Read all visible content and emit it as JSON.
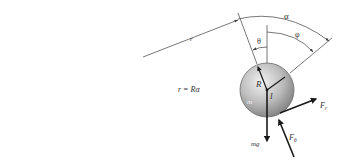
{
  "diagram": {
    "type": "physics-free-body-diagram",
    "labels": {
      "r": "r",
      "alpha": "α",
      "theta": "θ",
      "phi": "φ",
      "R": "R",
      "I": "I",
      "m": "m",
      "mg": "mg",
      "F_r_main": "F",
      "F_r_sub": "r",
      "F_theta_main": "F",
      "F_theta_sub": "θ",
      "equation": "r = Rα"
    },
    "colors": {
      "line": "#555555",
      "arrow": "#1a1a1a",
      "ball_light": "#e6e6e6",
      "ball_dark": "#8a8a8a",
      "text": "#333333"
    }
  }
}
